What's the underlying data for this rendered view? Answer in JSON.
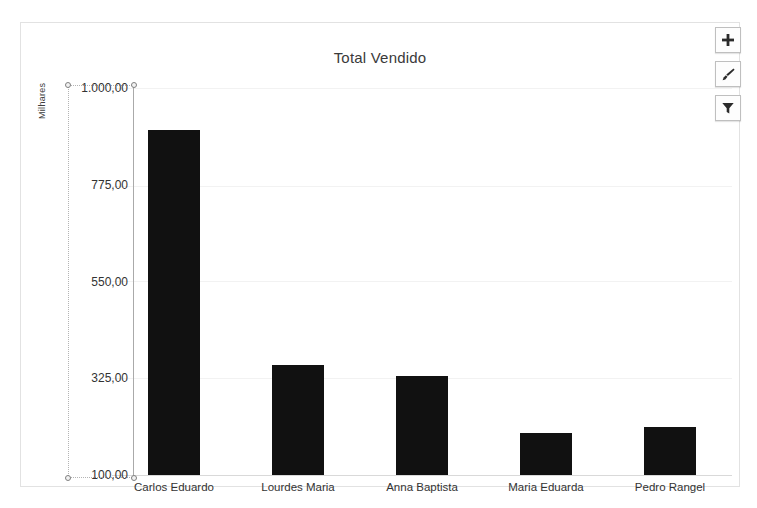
{
  "chart": {
    "title": "Total Vendido",
    "y_axis_title": "Milhares",
    "selected_element": "vertical-value-axis"
  },
  "buttons": [
    {
      "name": "chart-elements-button",
      "icon": "plus-icon",
      "label": "+"
    },
    {
      "name": "chart-styles-button",
      "icon": "paintbrush-icon",
      "label": ""
    },
    {
      "name": "chart-filters-button",
      "icon": "funnel-icon",
      "label": ""
    }
  ],
  "chart_data": {
    "type": "bar",
    "title": "Total Vendido",
    "xlabel": "",
    "ylabel": "Milhares",
    "ylim": [
      100,
      1000
    ],
    "ytick_labels": [
      "100,00",
      "325,00",
      "550,00",
      "775,00",
      "1.000,00"
    ],
    "ytick_values": [
      100,
      325,
      550,
      775,
      1000
    ],
    "grid": true,
    "legend": "none",
    "bar_color": "#111111",
    "categories": [
      "Carlos Eduardo",
      "Lourdes Maria",
      "Anna Baptista",
      "Maria Eduarda",
      "Pedro Rangel"
    ],
    "values": [
      902,
      355,
      330,
      198,
      212
    ]
  }
}
